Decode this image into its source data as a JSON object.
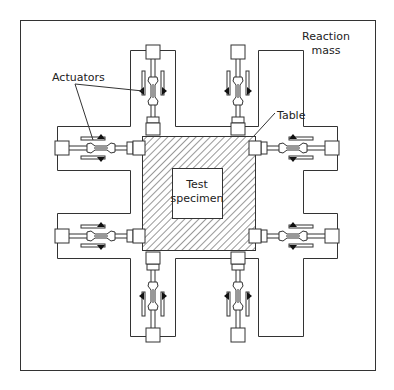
{
  "diagram": {
    "type": "shake-table-schematic",
    "labels": {
      "reaction_mass_line1": "Reaction",
      "reaction_mass_line2": "mass",
      "actuators": "Actuators",
      "table": "Table",
      "specimen_line1": "Test",
      "specimen_line2": "specimen"
    },
    "components": {
      "frame": "Reaction mass",
      "table": "Table (hatched)",
      "specimen": "Test specimen",
      "actuator_count": 8,
      "actuator_positions": [
        "top-left",
        "top-right",
        "left-upper",
        "left-lower",
        "right-upper",
        "right-lower",
        "bottom-left",
        "bottom-right"
      ]
    },
    "colors": {
      "line": "#333333",
      "background": "#ffffff",
      "fill_dark": "#111111"
    }
  }
}
